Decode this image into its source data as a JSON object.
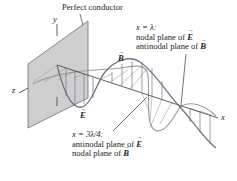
{
  "figure": {
    "title_label": "Perfect conductor",
    "axes": {
      "x": "x",
      "y": "y",
      "z": "z"
    },
    "field_labels": {
      "E": "E",
      "B": "B"
    },
    "annotation_lambda": {
      "equation": "x = λ:",
      "line1_prefix": "nodal plane of ",
      "line1_field": "E",
      "line2_prefix": "antinodal plane of ",
      "line2_field": "B"
    },
    "annotation_three_quarter": {
      "equation": "x = 3λ/4:",
      "line1_prefix": "antinodal plane of ",
      "line1_field": "E",
      "line2_prefix": "nodal plane of ",
      "line2_field": "B"
    },
    "colors": {
      "plane_fill": "#cfcfcf",
      "plane_edge": "#6d6d6d",
      "e_wave": "#7b6e86",
      "b_wave": "#9aa39a",
      "axis": "#3a3a3a",
      "text": "#231f20"
    }
  }
}
